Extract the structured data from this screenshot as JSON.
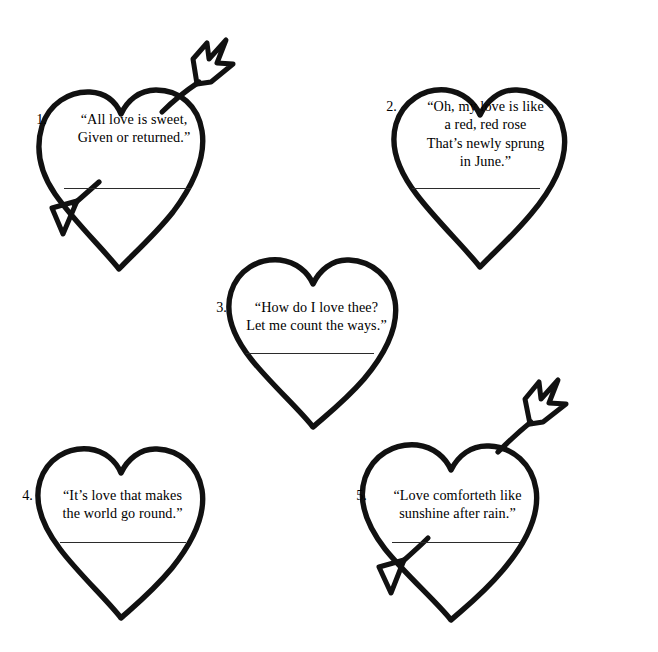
{
  "worksheet": {
    "background_color": "#ffffff",
    "ink_color": "#111111",
    "rule_color": "#2b2b2b",
    "item_count": 5
  },
  "hearts": [
    {
      "number": "1.",
      "lines": [
        "“All love is sweet,",
        "Given or returned.”"
      ],
      "has_arrow": true,
      "arrow_direction": "upper-right to lower-left"
    },
    {
      "number": "2.",
      "lines": [
        "“Oh, my love is like",
        "a red, red rose",
        "That’s newly sprung",
        "in June.”"
      ],
      "has_arrow": false,
      "arrow_direction": ""
    },
    {
      "number": "3.",
      "lines": [
        "“How do I love thee?",
        "Let me count the ways.”"
      ],
      "has_arrow": false,
      "arrow_direction": ""
    },
    {
      "number": "4.",
      "lines": [
        "“It’s love that makes",
        "the world go round.”"
      ],
      "has_arrow": false,
      "arrow_direction": ""
    },
    {
      "number": "5.",
      "lines": [
        "“Love comforteth like",
        "sunshine after rain.”"
      ],
      "has_arrow": true,
      "arrow_direction": "upper-right to lower-left"
    }
  ]
}
